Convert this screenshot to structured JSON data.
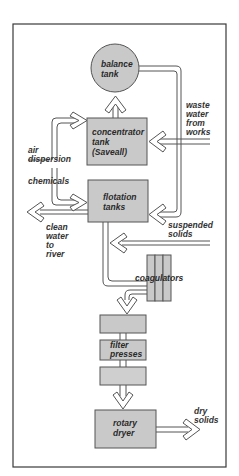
{
  "diagram": {
    "colors": {
      "frame": "#3a3a3a",
      "box_fill": "#c9c9c9",
      "box_stroke": "#555555",
      "pipe": "#555555",
      "text": "#2a2a2a",
      "background": "#ffffff"
    },
    "nodes": {
      "balance_tank": {
        "line1": "balance",
        "line2": "tank"
      },
      "concentrator": {
        "line1": "concentrator",
        "line2": "tank",
        "line3": "(Saveall)"
      },
      "flotation": {
        "line1": "flotation",
        "line2": "tanks"
      },
      "coagulators": {
        "label": "coagulators"
      },
      "filter_presses": {
        "line1": "filter",
        "line2": "presses"
      },
      "rotary_dryer": {
        "line1": "rotary",
        "line2": "dryer"
      }
    },
    "flows": {
      "waste_water": {
        "line1": "waste",
        "line2": "water",
        "line3": "from",
        "line4": "works"
      },
      "air_dispersion": {
        "line1": "air",
        "line2": "dispersion"
      },
      "chemicals": {
        "label": "chemicals"
      },
      "clean_water": {
        "line1": "clean",
        "line2": "water",
        "line3": "to",
        "line4": "river"
      },
      "suspended_solids": {
        "line1": "suspended",
        "line2": "solids"
      },
      "dry_solids": {
        "line1": "dry",
        "line2": "solids"
      }
    }
  }
}
